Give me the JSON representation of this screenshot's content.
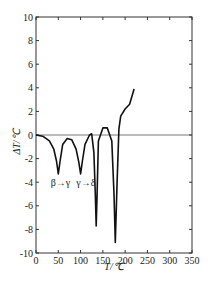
{
  "chart_data": {
    "type": "line",
    "title": "",
    "xlabel": "T/℃",
    "ylabel": "ΔT/℃",
    "xlim": [
      0,
      350
    ],
    "ylim": [
      -10,
      10
    ],
    "x_ticks": [
      0,
      50,
      100,
      150,
      200,
      250,
      300,
      350
    ],
    "y_ticks": [
      -10,
      -8,
      -6,
      -4,
      -2,
      0,
      2,
      4,
      6,
      8,
      10
    ],
    "grid": false,
    "legend": null,
    "annotations": [
      {
        "text": "β→γ",
        "x": 55,
        "y": -4.3
      },
      {
        "text": "γ→δ",
        "x": 112,
        "y": -4.3
      }
    ],
    "series": [
      {
        "name": "DTA",
        "x": [
          0,
          15,
          30,
          40,
          46,
          50,
          54,
          60,
          70,
          80,
          90,
          96,
          100,
          104,
          110,
          120,
          125,
          130,
          133,
          135,
          137,
          140,
          150,
          160,
          170,
          175,
          178,
          182,
          186,
          190,
          200,
          210,
          220
        ],
        "y": [
          0,
          -0.1,
          -0.5,
          -1.2,
          -2.2,
          -3.3,
          -2.2,
          -0.8,
          -0.3,
          -0.4,
          -1.2,
          -2.3,
          -3.3,
          -2.2,
          -0.8,
          0.0,
          0.1,
          -1.5,
          -5,
          -7.7,
          -5,
          -0.5,
          0.6,
          0.6,
          -0.5,
          -5,
          -9.1,
          -4,
          0.5,
          1.6,
          2.2,
          2.6,
          3.9
        ]
      }
    ]
  }
}
